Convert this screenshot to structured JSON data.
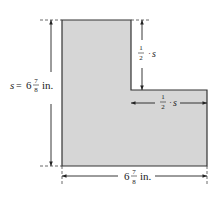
{
  "figure": {
    "shape": "L-shaped region",
    "fill_color": "#d6d6d6",
    "stroke_color": "#333333"
  },
  "labels": {
    "left_dimension": {
      "var": "s",
      "eq": "=",
      "whole": "6",
      "num": "7",
      "den": "8",
      "unit": "in."
    },
    "bottom_dimension": {
      "whole": "6",
      "num": "7",
      "den": "8",
      "unit": "in."
    },
    "notch_vertical_dimension": {
      "num": "1",
      "den": "2",
      "op": "·",
      "var": "s"
    },
    "notch_horizontal_dimension": {
      "num": "1",
      "den": "2",
      "op": "·",
      "var": "s"
    }
  }
}
